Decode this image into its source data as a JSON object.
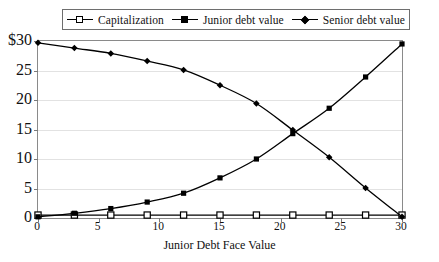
{
  "chart_data": {
    "type": "line",
    "title": "",
    "xlabel": "Junior Debt Face Value",
    "ylabel": "",
    "xlim": [
      0,
      30
    ],
    "ylim": [
      0,
      30
    ],
    "xticks": [
      "0",
      "5",
      "10",
      "15",
      "20",
      "25",
      "30"
    ],
    "yticks": [
      "0",
      "5",
      "10",
      "15",
      "20",
      "25",
      "$30"
    ],
    "grid": "horizontal",
    "legend_position": "top",
    "x": [
      0,
      3,
      6,
      9,
      12,
      15,
      18,
      21,
      24,
      27,
      30
    ],
    "series": [
      {
        "name": "Capitalization",
        "marker": "open-square",
        "values": [
          0.5,
          0.5,
          0.5,
          0.5,
          0.5,
          0.5,
          0.5,
          0.5,
          0.5,
          0.5,
          0.5
        ]
      },
      {
        "name": "Junior debt value",
        "marker": "filled-square",
        "values": [
          0.2,
          0.8,
          1.6,
          2.7,
          4.2,
          6.8,
          10.0,
          14.3,
          18.6,
          23.9,
          29.5
        ]
      },
      {
        "name": "Senior debt value",
        "marker": "filled-diamond",
        "values": [
          29.7,
          28.8,
          27.9,
          26.6,
          25.1,
          22.5,
          19.4,
          14.9,
          10.3,
          5.1,
          0.2
        ]
      }
    ]
  },
  "legend": {
    "items": [
      {
        "label": "Capitalization",
        "marker": "open-square"
      },
      {
        "label": "Junior debt value",
        "marker": "filled-square"
      },
      {
        "label": "Senior debt value",
        "marker": "filled-diamond"
      }
    ]
  },
  "axes": {
    "x_axis_title": "Junior Debt Face Value"
  },
  "colors": {
    "series_line": "#000000",
    "gridline": "#e2e2e2",
    "axis": "#8a8a8a",
    "background": "#ffffff",
    "text": "#111111"
  }
}
